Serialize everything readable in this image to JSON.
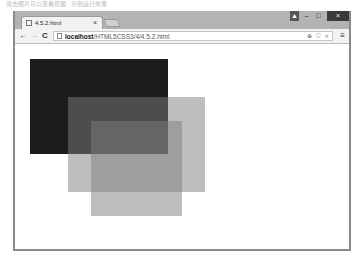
{
  "caption": "双击图片可以查看原图 · 示例运行效果",
  "browser": {
    "tab": {
      "title": "4.5.2.html",
      "close": "×",
      "favicon": "page-icon"
    },
    "window_controls": {
      "user": "▲",
      "minimize": "–",
      "maximize": "□",
      "close": "×"
    },
    "nav": {
      "back": "←",
      "forward": "→",
      "reload": "C"
    },
    "address": {
      "host": "localhost",
      "path": "/HTML5CSS3/4/4.5.2.html",
      "icons": [
        "zoom-icon",
        "shield-icon",
        "star-icon"
      ],
      "zoom_glyph": "⊕",
      "shield_glyph": "⛉",
      "star_glyph": "★"
    },
    "menu": "≡"
  },
  "content": {
    "rects": [
      {
        "name": "black-rectangle",
        "left": 15,
        "top": 15,
        "width": 138,
        "height": 95,
        "color": "#1c1c1c",
        "opacity": 1
      },
      {
        "name": "gray-rectangle-1",
        "left": 53,
        "top": 53,
        "width": 137,
        "height": 95,
        "color": "#7d7d7d",
        "opacity": 0.5
      },
      {
        "name": "gray-rectangle-2",
        "left": 76,
        "top": 77,
        "width": 91,
        "height": 95,
        "color": "#7d7d7d",
        "opacity": 0.5
      }
    ]
  }
}
